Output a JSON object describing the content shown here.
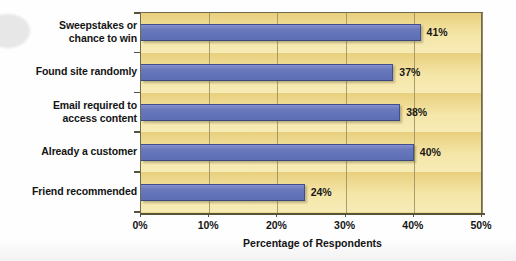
{
  "chart_data": {
    "type": "bar",
    "orientation": "horizontal",
    "title": "",
    "xlabel": "Percentage of Respondents",
    "ylabel": "",
    "xlim": [
      0,
      50
    ],
    "xticks": [
      "0%",
      "10%",
      "20%",
      "30%",
      "40%",
      "50%"
    ],
    "xtick_values": [
      0,
      10,
      20,
      30,
      40,
      50
    ],
    "grid": true,
    "legend": false,
    "categories": [
      "Sweepstakes or chance to win",
      "Found site randomly",
      "Email required to access content",
      "Already a customer",
      "Friend recommended"
    ],
    "category_lines": [
      [
        "Sweepstakes or",
        "chance to win"
      ],
      [
        "Found site randomly"
      ],
      [
        "Email required to",
        "access content"
      ],
      [
        "Already a customer"
      ],
      [
        "Friend recommended"
      ]
    ],
    "values": [
      41,
      37,
      38,
      40,
      24
    ],
    "data_labels": [
      "41%",
      "37%",
      "38%",
      "40%",
      "24%"
    ],
    "bar_color": "#6a79bd",
    "plot_background": "#f3e2a0",
    "axis_color": "#57543c",
    "gridline_color": "#9b8f5e",
    "text_color": "#141414"
  }
}
